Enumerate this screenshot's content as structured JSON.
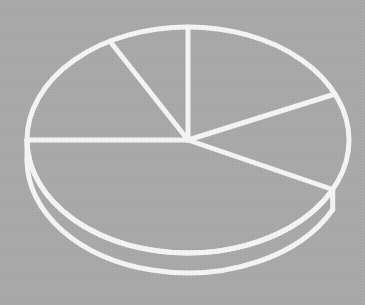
{
  "chart_data": {
    "type": "pie",
    "title": "",
    "subtitle": "",
    "xlabel": "",
    "ylabel": "",
    "grid": false,
    "legend_position": "none",
    "style": "3d-exploded-outline",
    "rendering": "outline-only white strokes on flat gray background, no fills, no labels",
    "background_color": "#a8a8a8",
    "stroke_color": "#f4f4f4",
    "slice_count": 5,
    "categories": [
      "Slice 1",
      "Slice 2",
      "Slice 3",
      "Slice 4",
      "Slice 5"
    ],
    "values": [
      8,
      17,
      43,
      14,
      18
    ],
    "value_unit": "percent",
    "angles_deg": [
      29,
      61,
      154,
      50,
      66
    ],
    "start_angle_deg": 90,
    "direction": "counterclockwise",
    "slices": [
      {
        "name": "Slice 1",
        "value": 8,
        "angle_deg": 29,
        "start_deg": 90,
        "end_deg": 119
      },
      {
        "name": "Slice 2",
        "value": 17,
        "angle_deg": 61,
        "start_deg": 119,
        "end_deg": 180
      },
      {
        "name": "Slice 3",
        "value": 43,
        "angle_deg": 154,
        "start_deg": 180,
        "end_deg": 334
      },
      {
        "name": "Slice 4",
        "value": 14,
        "angle_deg": 50,
        "start_deg": 334,
        "end_deg": 384
      },
      {
        "name": "Slice 5",
        "value": 18,
        "angle_deg": 66,
        "start_deg": 24,
        "end_deg": 90
      }
    ],
    "geometry": {
      "center_x": 188,
      "center_y": 140,
      "radius_x": 161,
      "radius_y": 113,
      "depth_px": 20,
      "stroke_width": 5
    },
    "annotations": []
  },
  "figure": {
    "canvas_width": 365,
    "canvas_height": 305,
    "alt_text": "Outline drawing of a three-dimensional pie chart with five wedges, drawn in thick white lines on a gray background."
  }
}
